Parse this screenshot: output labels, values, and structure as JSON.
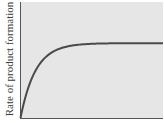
{
  "chart_data": {
    "type": "line",
    "title": "",
    "xlabel": "",
    "ylabel": "Rate of product formation",
    "grid": false,
    "legend": null,
    "x_ticks": [],
    "y_ticks": [],
    "series": [
      {
        "name": "rate",
        "x": [
          0,
          0.05,
          0.1,
          0.15,
          0.2,
          0.3,
          0.4,
          0.5,
          0.6,
          0.7,
          0.8,
          0.9,
          1.0
        ],
        "y": [
          0,
          0.37,
          0.6,
          0.75,
          0.84,
          0.94,
          0.98,
          0.995,
          1.0,
          1.0,
          1.0,
          1.0,
          1.0
        ]
      }
    ],
    "xlim": [
      0,
      1
    ],
    "ylim": [
      0,
      1.55
    ],
    "colors": {
      "background": "#e6e6e6",
      "curve": "#4a4a4a",
      "axes": "#555555"
    }
  }
}
